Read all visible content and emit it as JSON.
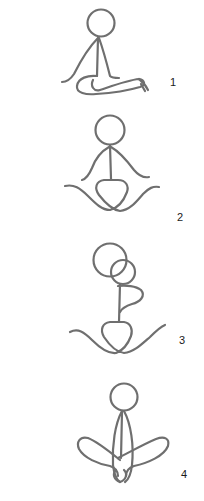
{
  "diagram": {
    "line_color": "#6f6f6f",
    "background": "#ffffff",
    "figures": [
      {
        "id": 1,
        "label": "1",
        "pose": "seated with legs extended to the side"
      },
      {
        "id": 2,
        "label": "2",
        "pose": "cross-legged, arms resting on knees"
      },
      {
        "id": 3,
        "label": "3",
        "pose": "cross-legged, head turned/tilted, arm looped"
      },
      {
        "id": 4,
        "label": "4",
        "pose": "seated, knees up, arms wrapped, feet together"
      }
    ]
  }
}
